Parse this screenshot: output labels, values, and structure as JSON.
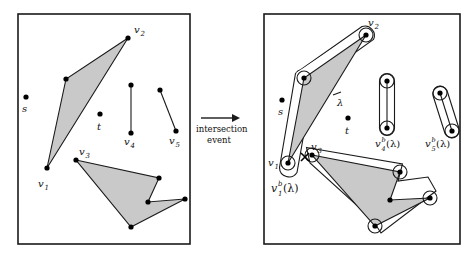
{
  "figure": {
    "colors": {
      "frame_stroke": "#1a1a1a",
      "polygon_fill": "#c9c9c9",
      "polygon_stroke": "#1a1a1a",
      "offset_stroke": "#1a1a1a",
      "offset_fill": "#ffffff",
      "vertex_fill": "#000000",
      "background": "#ffffff",
      "text": "#111111"
    }
  },
  "transition": {
    "arrow_icon": "right-arrow-icon",
    "line1": "intersection",
    "line2": "event"
  },
  "left_panel": {
    "name": "before-panel",
    "frame": {
      "x": 18,
      "y": 14,
      "w": 172,
      "h": 230
    },
    "point_labels": [
      {
        "id": "s",
        "text": "s",
        "x": 22,
        "y": 105
      },
      {
        "id": "t",
        "text": "t",
        "x": 97,
        "y": 122
      },
      {
        "id": "v1",
        "text": "v",
        "sub": "1",
        "x": 38,
        "y": 184
      },
      {
        "id": "v2",
        "text": "v",
        "sub": "2",
        "x": 133,
        "y": 27
      },
      {
        "id": "v3",
        "text": "v",
        "sub": "3",
        "x": 73,
        "y": 150
      },
      {
        "id": "v4",
        "text": "v",
        "sub": "4",
        "x": 130,
        "y": 140
      },
      {
        "id": "v5",
        "text": "v",
        "sub": "5",
        "x": 165,
        "y": 139
      }
    ],
    "free_points": [
      {
        "id": "s-point",
        "x": 26,
        "y": 97
      },
      {
        "id": "t-point",
        "x": 100,
        "y": 114
      }
    ],
    "polygon_upper": {
      "name": "upper-triangle-obstacle",
      "vertices": [
        [
          47,
          168
        ],
        [
          66,
          79
        ],
        [
          128,
          38
        ]
      ]
    },
    "polygon_lower": {
      "name": "lower-polygon-obstacle",
      "vertices": [
        [
          76,
          160
        ],
        [
          159,
          178
        ],
        [
          148,
          202
        ],
        [
          185,
          199
        ],
        [
          131,
          227
        ]
      ]
    },
    "segment_v4": {
      "name": "segment-v4",
      "from": [
        131,
        85
      ],
      "to": [
        131,
        133
      ]
    },
    "segment_v5": {
      "name": "segment-v5",
      "from": [
        160,
        90
      ],
      "to": [
        176,
        131
      ]
    }
  },
  "right_panel": {
    "name": "after-panel",
    "frame": {
      "x": 264,
      "y": 14,
      "w": 196,
      "h": 230
    },
    "point_labels": [
      {
        "id": "s",
        "text": "s",
        "x": 278,
        "y": 108
      },
      {
        "id": "t",
        "text": "t",
        "x": 345,
        "y": 126
      },
      {
        "id": "v1",
        "text": "v",
        "sub": "1",
        "x": 272,
        "y": 162
      },
      {
        "id": "v2",
        "text": "v",
        "sub": "2",
        "x": 370,
        "y": 20
      },
      {
        "id": "v3",
        "text": "v",
        "sub": "3",
        "x": 313,
        "y": 148
      },
      {
        "id": "lambda",
        "text": "λ",
        "x": 339,
        "y": 100
      }
    ],
    "offset_labels": [
      {
        "id": "v1b",
        "base": "v",
        "sub": "1",
        "sup": "b",
        "arg": "(λ)",
        "x": 272,
        "y": 186
      },
      {
        "id": "v4b",
        "base": "v",
        "sub": "4",
        "sup": "b",
        "arg": "(λ)",
        "x": 377,
        "y": 141
      },
      {
        "id": "v5b",
        "base": "v",
        "sub": "5",
        "sup": "b",
        "arg": "(λ)",
        "x": 427,
        "y": 141
      }
    ],
    "free_points": [
      {
        "id": "s-point",
        "x": 282,
        "y": 100
      },
      {
        "id": "t-point",
        "x": 348,
        "y": 118
      }
    ],
    "intersection_marker": {
      "id": "intersection-cross",
      "x": 305,
      "y": 157
    },
    "polygon_upper": {
      "name": "upper-triangle-obstacle",
      "vertices": [
        [
          288,
          163
        ],
        [
          304,
          78
        ],
        [
          366,
          35
        ]
      ]
    },
    "polygon_lower": {
      "name": "lower-polygon-obstacle",
      "vertices": [
        [
          312,
          155
        ],
        [
          400,
          172
        ],
        [
          390,
          200
        ],
        [
          430,
          198
        ],
        [
          375,
          226
        ]
      ]
    },
    "segment_v4": {
      "name": "segment-v4",
      "from": [
        387,
        81
      ],
      "to": [
        387,
        128
      ]
    },
    "segment_v5": {
      "name": "segment-v5",
      "from": [
        440,
        93
      ],
      "to": [
        452,
        131
      ]
    },
    "ringed_vertices": [
      {
        "x": 288,
        "y": 163
      },
      {
        "x": 304,
        "y": 78
      },
      {
        "x": 366,
        "y": 35
      },
      {
        "x": 312,
        "y": 155
      },
      {
        "x": 400,
        "y": 172
      },
      {
        "x": 375,
        "y": 226
      },
      {
        "x": 430,
        "y": 198
      },
      {
        "x": 387,
        "y": 81
      },
      {
        "x": 387,
        "y": 128
      },
      {
        "x": 440,
        "y": 93
      },
      {
        "x": 452,
        "y": 131
      }
    ]
  }
}
